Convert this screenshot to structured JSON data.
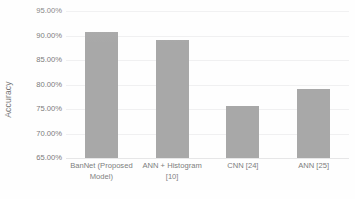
{
  "chart_data": {
    "type": "bar",
    "title": "",
    "subtitle": "",
    "xlabel": "",
    "ylabel": "Accuracy",
    "categories": [
      "BanNet (Proposed Model)",
      "ANN + Histogram [10]",
      "CNN [24]",
      "ANN [25]"
    ],
    "values": [
      0.908,
      0.89,
      0.756,
      0.791
    ],
    "value_labels": [
      "90.80%",
      "89.00%",
      "75.60%",
      "79.10%"
    ],
    "ylim": [
      0.65,
      0.95
    ],
    "ytick_values": [
      0.95,
      0.9,
      0.85,
      0.8,
      0.75,
      0.7,
      0.65
    ],
    "ytick_labels": [
      "95.00%",
      "90.00%",
      "85.00%",
      "80.00%",
      "75.00%",
      "70.00%",
      "65.00%"
    ],
    "grid": true,
    "legend": false,
    "legend_position": "none",
    "bar_color": "#a8a8a8",
    "gridline_color": "#f0f0f1",
    "text_color": "#7a7a7a",
    "background_color": "#ffffff"
  }
}
